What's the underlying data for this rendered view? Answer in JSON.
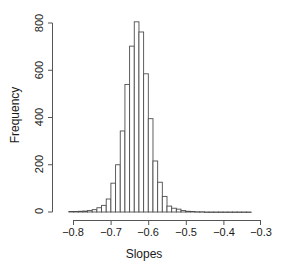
{
  "chart_data": {
    "type": "bar",
    "subtype": "histogram",
    "title": "",
    "xlabel": "Slopes",
    "ylabel": "Frequency",
    "xlim": [
      -0.82,
      -0.3
    ],
    "ylim": [
      0,
      830
    ],
    "xticks": [
      -0.8,
      -0.7,
      -0.6,
      -0.5,
      -0.4,
      -0.3
    ],
    "xtick_labels": [
      "−0.8",
      "−0.7",
      "−0.6",
      "−0.5",
      "−0.4",
      "−0.3"
    ],
    "yticks": [
      0,
      200,
      400,
      600,
      800
    ],
    "ytick_labels": [
      "0",
      "200",
      "400",
      "600",
      "800"
    ],
    "grid": false,
    "legend": null,
    "bin_width": 0.0125,
    "bin_edges": [
      -0.8125,
      -0.8,
      -0.7875,
      -0.775,
      -0.7625,
      -0.75,
      -0.7375,
      -0.725,
      -0.7125,
      -0.7,
      -0.6875,
      -0.675,
      -0.6625,
      -0.65,
      -0.6375,
      -0.625,
      -0.6125,
      -0.6,
      -0.5875,
      -0.575,
      -0.5625,
      -0.55,
      -0.5375,
      -0.525,
      -0.5125,
      -0.5,
      -0.4875,
      -0.475,
      -0.4625,
      -0.45,
      -0.4375,
      -0.425,
      -0.4125,
      -0.4,
      -0.3875,
      -0.375,
      -0.3625,
      -0.35,
      -0.3375,
      -0.325
    ],
    "bin_centers": [
      -0.80625,
      -0.79375,
      -0.78125,
      -0.76875,
      -0.75625,
      -0.74375,
      -0.73125,
      -0.71875,
      -0.70625,
      -0.69375,
      -0.68125,
      -0.66875,
      -0.65625,
      -0.64375,
      -0.63125,
      -0.61875,
      -0.60625,
      -0.59375,
      -0.58125,
      -0.56875,
      -0.55625,
      -0.54375,
      -0.53125,
      -0.51875,
      -0.50625,
      -0.49375,
      -0.48125,
      -0.46875,
      -0.45625,
      -0.44375,
      -0.43125,
      -0.41875,
      -0.40625,
      -0.39375,
      -0.38125,
      -0.36875,
      -0.35625,
      -0.34375,
      -0.33125,
      -0.31875
    ],
    "values": [
      2,
      2,
      3,
      4,
      6,
      10,
      18,
      28,
      55,
      122,
      200,
      343,
      540,
      702,
      805,
      762,
      585,
      395,
      216,
      126,
      66,
      25,
      16,
      12,
      6,
      3,
      2,
      1,
      1,
      0,
      0,
      0,
      0,
      0,
      0,
      0,
      0,
      0,
      0,
      0
    ],
    "peak_value": 805,
    "peak_center": -0.59375
  },
  "axes": {
    "y_title": "Frequency",
    "x_title": "Slopes"
  }
}
